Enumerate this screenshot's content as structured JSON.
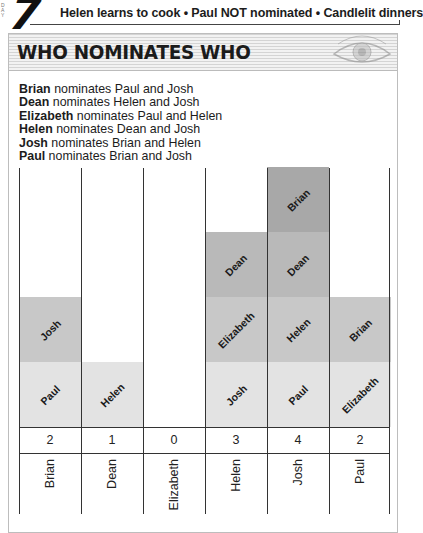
{
  "header": {
    "day_number": "7",
    "side_text": "DAY",
    "headline": "Helen learns to cook • Paul NOT nominated • Candlelit dinners"
  },
  "panel": {
    "title": "WHO NOMINATES WHO",
    "icon": "eye-icon"
  },
  "nominations": [
    {
      "nominator": "Brian",
      "text": " nominates Paul and Josh"
    },
    {
      "nominator": "Dean",
      "text": " nominates Helen and Josh"
    },
    {
      "nominator": "Elizabeth",
      "text": " nominates Paul and Helen"
    },
    {
      "nominator": "Helen",
      "text": " nominates Dean and Josh"
    },
    {
      "nominator": "Josh",
      "text": " nominates Brian and Helen"
    },
    {
      "nominator": "Paul",
      "text": " nominates Brian and Josh"
    }
  ],
  "colors": {
    "level1": "#e3e3e3",
    "level2": "#c8c8c8",
    "level3": "#b9b9b9",
    "level4": "#a8a8a8",
    "lines": "#333333"
  },
  "chart_data": {
    "type": "bar",
    "title": "WHO NOMINATES WHO",
    "subtype": "stacked",
    "xlabel": "",
    "ylabel": "",
    "categories": [
      "Brian",
      "Dean",
      "Elizabeth",
      "Helen",
      "Josh",
      "Paul"
    ],
    "values": [
      2,
      1,
      0,
      3,
      4,
      2
    ],
    "ylim": [
      0,
      4
    ],
    "grid": false,
    "legend": "none",
    "stacks": [
      {
        "nominee": "Brian",
        "nominated_by": [
          "Paul",
          "Josh"
        ]
      },
      {
        "nominee": "Dean",
        "nominated_by": [
          "Helen"
        ]
      },
      {
        "nominee": "Elizabeth",
        "nominated_by": []
      },
      {
        "nominee": "Helen",
        "nominated_by": [
          "Josh",
          "Elizabeth",
          "Dean"
        ]
      },
      {
        "nominee": "Josh",
        "nominated_by": [
          "Paul",
          "Helen",
          "Dean",
          "Brian"
        ]
      },
      {
        "nominee": "Paul",
        "nominated_by": [
          "Elizabeth",
          "Brian"
        ]
      }
    ]
  }
}
